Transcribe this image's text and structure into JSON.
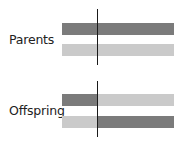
{
  "colors": {
    "dark": "#7b7b7b",
    "light": "#cacaca",
    "line": "#1a1a1a",
    "text": "#222222"
  },
  "groups": [
    {
      "label": "Parents",
      "bars": [
        {
          "segments": [
            {
              "shade": "dark"
            },
            {
              "shade": "dark"
            }
          ]
        },
        {
          "segments": [
            {
              "shade": "light"
            },
            {
              "shade": "light"
            }
          ]
        }
      ]
    },
    {
      "label": "Offspring",
      "bars": [
        {
          "segments": [
            {
              "shade": "dark"
            },
            {
              "shade": "light"
            }
          ]
        },
        {
          "segments": [
            {
              "shade": "light"
            },
            {
              "shade": "dark"
            }
          ]
        }
      ]
    }
  ]
}
